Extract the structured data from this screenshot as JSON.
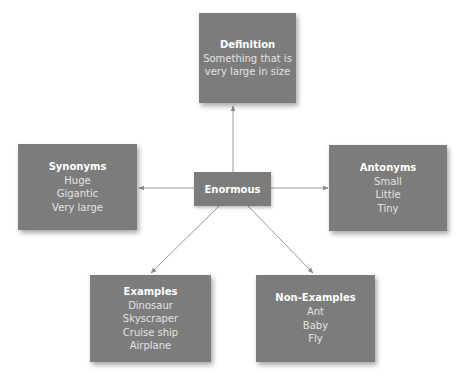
{
  "diagram": {
    "type": "concept-map (Frayer model)",
    "center": {
      "label": "Enormous"
    },
    "nodes": {
      "definition": {
        "title": "Definition",
        "lines": [
          "Something that is",
          "very large in size"
        ]
      },
      "synonyms": {
        "title": "Synonyms",
        "lines": [
          "Huge",
          "Gigantic",
          "Very large"
        ]
      },
      "antonyms": {
        "title": "Antonyms",
        "lines": [
          "Small",
          "Little",
          "Tiny"
        ]
      },
      "examples": {
        "title": "Examples",
        "lines": [
          "Dinosaur",
          "Skyscraper",
          "Cruise ship",
          "Airplane"
        ]
      },
      "non_examples": {
        "title": "Non-Examples",
        "lines": [
          "Ant",
          "Baby",
          "Fly"
        ]
      }
    },
    "edges": [
      {
        "from": "Enormous",
        "to": "Definition"
      },
      {
        "from": "Enormous",
        "to": "Synonyms"
      },
      {
        "from": "Enormous",
        "to": "Antonyms"
      },
      {
        "from": "Enormous",
        "to": "Examples"
      },
      {
        "from": "Enormous",
        "to": "Non-Examples"
      }
    ],
    "colors": {
      "box_fill": "#7c7c7c",
      "title_text": "#ffffff",
      "body_text": "#e3e3e3",
      "connector": "#9a9a9a",
      "background": "#ffffff"
    }
  }
}
